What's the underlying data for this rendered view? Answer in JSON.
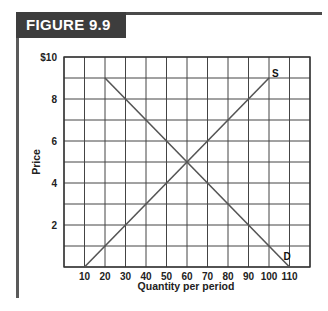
{
  "figure": {
    "label": "FIGURE 9.9"
  },
  "chart_data": {
    "type": "line",
    "title": "",
    "xlabel": "Quantity per period",
    "ylabel": "Price",
    "xlim": [
      0,
      120
    ],
    "ylim": [
      0,
      10
    ],
    "grid": true,
    "x_ticks": [
      10,
      20,
      30,
      40,
      50,
      60,
      70,
      80,
      90,
      100,
      110
    ],
    "x_tick_labels": [
      "10",
      "20",
      "30",
      "40",
      "50",
      "60",
      "70",
      "80",
      "90",
      "100",
      "110"
    ],
    "y_ticks": [
      2,
      4,
      6,
      8,
      10
    ],
    "y_tick_labels": [
      "2",
      "4",
      "6",
      "8",
      "$10"
    ],
    "series": [
      {
        "name": "S",
        "label": "S",
        "points": [
          [
            10,
            0
          ],
          [
            100,
            9
          ]
        ]
      },
      {
        "name": "D",
        "label": "D",
        "points": [
          [
            20,
            9
          ],
          [
            110,
            0
          ]
        ]
      }
    ],
    "equilibrium": {
      "quantity": 60,
      "price": 5
    },
    "line_color": "#555555",
    "grid_color": "#444444"
  }
}
